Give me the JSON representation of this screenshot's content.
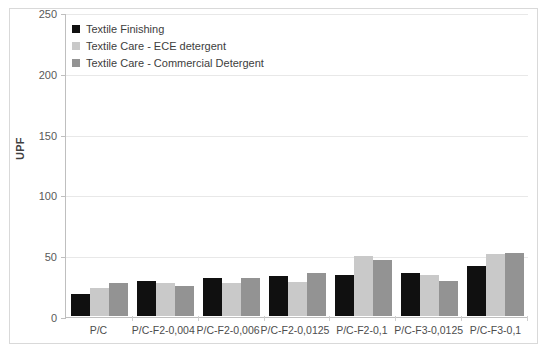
{
  "chart_data": {
    "type": "bar",
    "title": "",
    "xlabel": "",
    "ylabel": "UPF",
    "ylim": [
      0,
      250
    ],
    "yticks": [
      0,
      50,
      100,
      150,
      200,
      250
    ],
    "grid": true,
    "legend_position": "top-left",
    "categories": [
      "P/C",
      "P/C-F2-0,004",
      "P/C-F2-0,006",
      "P/C-F2-0,0125",
      "P/C-F2-0,1",
      "P/C-F3-0,0125",
      "P/C-F3-0,1"
    ],
    "series": [
      {
        "name": "Textile Finishing",
        "color": "#101010",
        "values": [
          18,
          29,
          31,
          33,
          34,
          35,
          41
        ]
      },
      {
        "name": "Textile Care - ECE detergent",
        "color": "#c9c9c9",
        "values": [
          23,
          27,
          27,
          28,
          49,
          34,
          51
        ]
      },
      {
        "name": "Textile Care - Commercial Detergent",
        "color": "#939393",
        "values": [
          27,
          25,
          31,
          35,
          46,
          29,
          52
        ]
      }
    ]
  },
  "axis": {
    "y_title": "UPF",
    "y_tick_labels": [
      "250",
      "200",
      "150",
      "100",
      "50",
      "0"
    ]
  },
  "top_sliver": {
    "text": ""
  }
}
